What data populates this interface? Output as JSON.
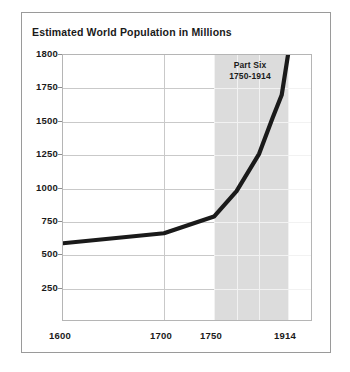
{
  "chart_data": {
    "type": "line",
    "title": "Estimated World Population in Millions",
    "xlabel": "",
    "ylabel": "",
    "grid": true,
    "legend": "none",
    "xlim": [
      1600,
      1914
    ],
    "ylim": [
      0,
      1800
    ],
    "x_ticks": [
      "1600",
      "1700",
      "1750",
      "1914"
    ],
    "x_tick_values": [
      1600,
      1700,
      1750,
      1914
    ],
    "y_ticks": [
      "250",
      "500",
      "750",
      "1000",
      "1250",
      "1500",
      "1750",
      "1800"
    ],
    "y_tick_values": [
      250,
      500,
      750,
      1000,
      1250,
      1500,
      1750,
      1800
    ],
    "x": [
      1600,
      1700,
      1750,
      1800,
      1850,
      1880,
      1900,
      1914
    ],
    "values": [
      590,
      665,
      790,
      980,
      1260,
      1530,
      1700,
      1800
    ],
    "series": [
      {
        "name": "Estimated world population",
        "color": "#1a1a1a",
        "values": [
          590,
          665,
          790,
          980,
          1260,
          1530,
          1700,
          1800
        ]
      }
    ],
    "shaded_region": {
      "label_line1": "Part Six",
      "label_line2": "1750-1914",
      "x_start": 1750,
      "x_end": 1914,
      "color": "#dcdcdc"
    }
  },
  "figure": {
    "title": "Estimated World Population in Millions",
    "background": "#ffffff",
    "border_color": "#9a9a9a",
    "line_color": "#1a1a1a",
    "band_color": "#dcdcdc"
  },
  "annotation": {
    "part_label": "Part Six",
    "part_range": "1750-1914"
  }
}
